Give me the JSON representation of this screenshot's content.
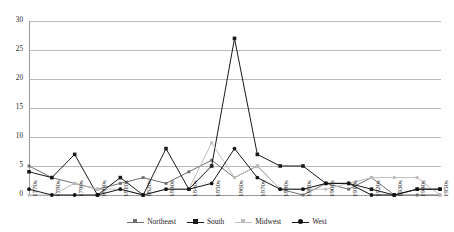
{
  "chart_data": {
    "type": "line",
    "title": "",
    "xlabel": "",
    "ylabel": "",
    "ylim": [
      0,
      30
    ],
    "yticks": [
      0,
      5,
      10,
      15,
      20,
      25,
      30
    ],
    "grid": true,
    "legend_position": "bottom",
    "categories": [
      "1770s",
      "1780s",
      "1790s",
      "1800s",
      "1810s",
      "1820s",
      "1830s",
      "1840s",
      "1850s",
      "1860s",
      "1870s",
      "1880s",
      "1890s",
      "1900s",
      "1910s",
      "1920s",
      "1930s",
      "1940s",
      "1950s"
    ],
    "series": [
      {
        "name": "Northeast",
        "color": "#6e6e6e",
        "marker": "square-small",
        "values": [
          5,
          3,
          2,
          1,
          2,
          3,
          2,
          4,
          6,
          3,
          5,
          1,
          0,
          2,
          1,
          3,
          0,
          0,
          0
        ]
      },
      {
        "name": "South",
        "color": "#1a1a1a",
        "marker": "square",
        "values": [
          4,
          3,
          7,
          0,
          3,
          0,
          8,
          1,
          5,
          27,
          7,
          5,
          5,
          2,
          2,
          1,
          0,
          1,
          1
        ]
      },
      {
        "name": "Midwest",
        "color": "#bdbdbd",
        "marker": "square-small",
        "values": [
          0,
          0,
          2,
          1,
          1,
          0,
          1,
          1,
          9,
          3,
          5,
          1,
          1,
          1,
          2,
          3,
          3,
          3,
          0
        ]
      },
      {
        "name": "West",
        "color": "#141414",
        "marker": "circle",
        "values": [
          1,
          0,
          0,
          0,
          1,
          0,
          1,
          1,
          2,
          8,
          3,
          1,
          1,
          2,
          2,
          0,
          0,
          1,
          1
        ]
      }
    ]
  },
  "axis": {
    "y_tick_labels": [
      "0",
      "5",
      "10",
      "15",
      "20",
      "25",
      "30"
    ]
  },
  "legend": {
    "items": [
      {
        "label": "Northeast"
      },
      {
        "label": "South"
      },
      {
        "label": "Midwest"
      },
      {
        "label": "West"
      }
    ]
  },
  "colors": {
    "northeast": "#6e6e6e",
    "south": "#1a1a1a",
    "midwest": "#bdbdbd",
    "west": "#141414",
    "gridline": "#b9b9b9",
    "axis": "#9a9a9a",
    "background": "#ffffff"
  }
}
